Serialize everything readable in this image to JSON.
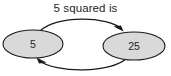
{
  "diagram": {
    "title": "5 squared is",
    "background_color": "#ffffff",
    "node_fill_color": "#d9d9d9",
    "node_stroke_color": "#1a1a1a",
    "edge_color": "#1a1a1a",
    "text_color": "#231f20",
    "nodes": [
      {
        "id": "source",
        "label": "5",
        "cx": 33,
        "cy": 44,
        "rx": 30,
        "ry": 14
      },
      {
        "id": "result",
        "label": "25",
        "cx": 134,
        "cy": 46,
        "rx": 31,
        "ry": 14
      }
    ],
    "edges": [
      {
        "id": "forward-edge",
        "from": "source",
        "to": "result",
        "direction": "left-to-right",
        "arrow_position": "right-end",
        "curve": "arc-above"
      },
      {
        "id": "return-edge",
        "from": "result",
        "to": "source",
        "direction": "right-to-left",
        "arrow_position": "left-end",
        "curve": "arc-below"
      }
    ]
  }
}
